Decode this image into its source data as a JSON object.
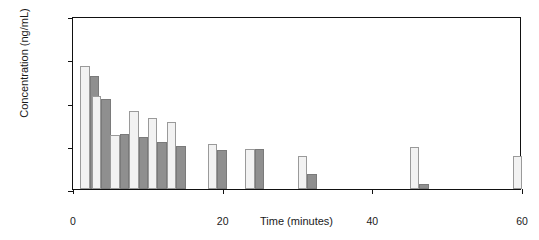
{
  "chart_data": {
    "type": "bar",
    "title": "",
    "xlabel": "Time (minutes)",
    "ylabel": "Concentration (ng/mL)",
    "yscale": "log",
    "ylim": [
      0.01,
      100
    ],
    "xlim": [
      0,
      60
    ],
    "grid": false,
    "legend": "none",
    "ytick_labels": [
      "100",
      "10",
      "1",
      "0.1",
      "0.01"
    ],
    "ytick_values": [
      100,
      10,
      1,
      0.1,
      0.01
    ],
    "xtick_labels": [
      "0",
      "20",
      "40",
      "60"
    ],
    "xtick_values": [
      0,
      20,
      40,
      60
    ],
    "x": [
      1,
      2.5,
      5,
      7.5,
      10,
      12.5,
      18,
      23,
      30,
      45,
      60
    ],
    "series": [
      {
        "name": "light",
        "values": [
          7.0,
          1.45,
          0.18,
          0.62,
          0.45,
          0.35,
          0.11,
          0.085,
          0.058,
          0.095,
          0.057
        ]
      },
      {
        "name": "dark",
        "values": [
          4.2,
          1.2,
          0.19,
          0.16,
          0.12,
          0.1,
          0.078,
          0.085,
          0.022,
          0.013,
          null
        ]
      }
    ],
    "colors": {
      "light_fill": "#f2f2f2",
      "light_edge": "#9a9a9a",
      "dark_fill": "#8f8f8f",
      "dark_edge": "#7a7a7a",
      "axis": "#111111",
      "background": "#ffffff"
    }
  }
}
